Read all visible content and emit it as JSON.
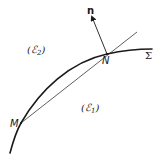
{
  "figure": {
    "type": "geometry-diagram",
    "stroke_color": "#1a1a1a",
    "background": "#ffffff"
  },
  "labels": {
    "region_upper": {
      "base": "(ℰ",
      "sub": "2",
      "close": ")"
    },
    "region_lower": {
      "base": "(ℰ",
      "sub": "1",
      "close": ")"
    },
    "point_m": "M",
    "point_n": "N",
    "normal_vector": "n",
    "surface": "Σ"
  },
  "geometry": {
    "surface_curve": {
      "start": [
        10,
        153
      ],
      "through": [
        [
          21,
          123
        ],
        [
          107,
          54
        ]
      ],
      "end": [
        152,
        49
      ]
    },
    "chord_line": {
      "start": [
        21,
        123
      ],
      "through": [
        107,
        54
      ],
      "end": [
        137,
        32
      ]
    },
    "normal_arrow": {
      "from": [
        107,
        54
      ],
      "to": [
        91,
        14
      ]
    }
  }
}
